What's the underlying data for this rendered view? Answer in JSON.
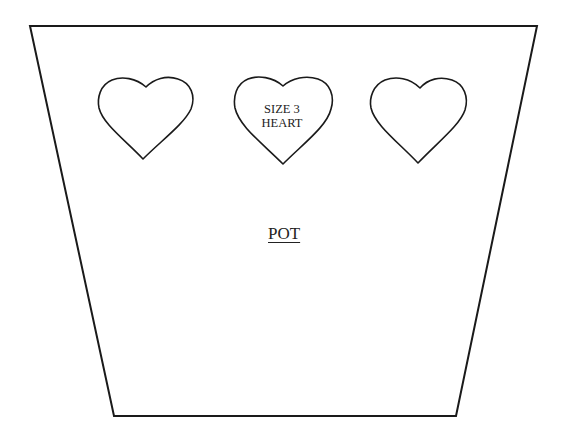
{
  "diagram": {
    "type": "craft-pattern-template",
    "background": "#ffffff",
    "stroke_color": "#1a1a1a",
    "pot": {
      "label": "POT",
      "shape": "trapezoid",
      "corners": {
        "top_left": [
          30,
          26
        ],
        "top_right": [
          537,
          26
        ],
        "bottom_right": [
          456,
          416
        ],
        "bottom_left": [
          114,
          416
        ]
      }
    },
    "hearts": [
      {
        "id": "heart-left",
        "label": "",
        "cx": 146,
        "top": 77,
        "width": 96,
        "tip": 159
      },
      {
        "id": "heart-center",
        "label_line1": "SIZE 3",
        "label_line2": "HEART",
        "cx": 283,
        "top": 77,
        "width": 99,
        "tip": 164
      },
      {
        "id": "heart-right",
        "label": "",
        "cx": 418,
        "top": 77,
        "width": 98,
        "tip": 163
      }
    ]
  }
}
